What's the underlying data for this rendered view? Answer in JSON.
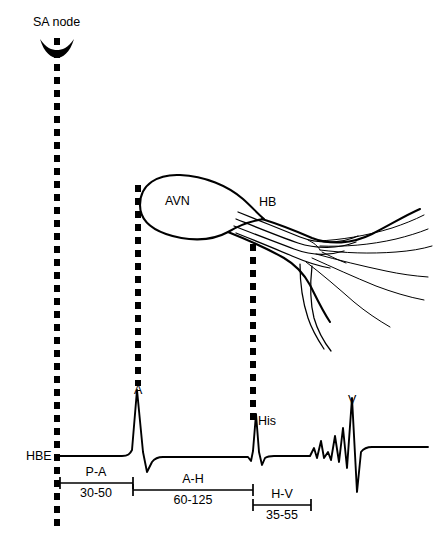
{
  "figure": {
    "background_color": "#ffffff",
    "ink_color": "#000000",
    "width": 435,
    "height": 545
  },
  "anatomy": {
    "sa_node": {
      "label": "SA node",
      "icon": "sa-node-crescent",
      "label_x": 33,
      "label_y": 26
    },
    "av_node": {
      "label": "AVN",
      "label_x": 165,
      "label_y": 205
    },
    "his_bundle": {
      "label": "HB",
      "label_x": 259,
      "label_y": 206
    }
  },
  "conduction_lines": [
    {
      "name": "sa-node-timing-line",
      "x": 57,
      "y_top": 38,
      "y_bottom": 531
    },
    {
      "name": "atrial-timing-line",
      "x": 138,
      "y_top": 185,
      "y_bottom": 386
    },
    {
      "name": "his-timing-line",
      "x": 253,
      "y_top": 244,
      "y_bottom": 426
    }
  ],
  "recording": {
    "channel_label": "HBE",
    "channel_label_x": 26,
    "channel_label_y": 460,
    "baseline_y": 456,
    "trace_start_x": 57,
    "trace_end_x": 428,
    "deflections": [
      {
        "name": "A",
        "label": "A",
        "label_x": 134,
        "label_y": 394,
        "peak_x": 137,
        "type": "atrial"
      },
      {
        "name": "His",
        "label": "His",
        "label_x": 258,
        "label_y": 425,
        "peak_x": 256,
        "type": "his"
      },
      {
        "name": "V",
        "label": "V",
        "label_x": 348,
        "label_y": 404,
        "peak_x": 352,
        "type": "ventricular"
      }
    ]
  },
  "intervals": [
    {
      "name": "P-A",
      "value": "30-50",
      "unit": "ms",
      "x_start": 60,
      "x_end": 133,
      "bar_y": 483,
      "name_x": 96,
      "name_y": 476,
      "value_x": 96,
      "value_y": 497
    },
    {
      "name": "A-H",
      "value": "60-125",
      "unit": "ms",
      "x_start": 133,
      "x_end": 253,
      "bar_y": 490,
      "name_x": 193,
      "name_y": 483,
      "value_x": 193,
      "value_y": 504
    },
    {
      "name": "H-V",
      "value": "35-55",
      "unit": "ms",
      "x_start": 253,
      "x_end": 311,
      "bar_y": 505,
      "name_x": 282,
      "name_y": 498,
      "value_x": 282,
      "value_y": 519
    }
  ]
}
